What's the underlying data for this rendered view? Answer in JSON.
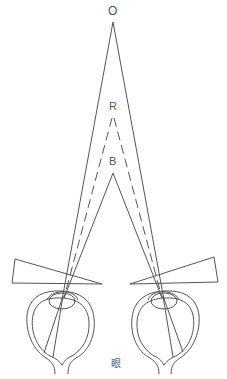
{
  "diagram": {
    "labels": {
      "object_point": "O",
      "red_image_point": "R",
      "blue_image_point": "B",
      "eye_caption": "眼"
    },
    "elements": {
      "object": "O",
      "images": [
        "R",
        "B"
      ],
      "prisms": [
        "left-prism",
        "right-prism"
      ],
      "eyes": [
        "left-eye",
        "right-eye"
      ]
    },
    "colors": {
      "stroke": "#555555",
      "background": "#ffffff"
    }
  }
}
